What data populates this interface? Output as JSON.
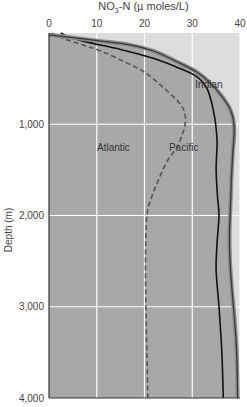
{
  "chart_data": {
    "type": "line",
    "title": "NO3-N (µ moles/L)",
    "xlabel": "NO3-N (µ moles/L)",
    "ylabel": "Depth (m)",
    "x_axis_position": "top",
    "y_axis_inverted": true,
    "xlim": [
      0,
      40
    ],
    "ylim": [
      0,
      4000
    ],
    "x_ticks": [
      0,
      10,
      20,
      30,
      40
    ],
    "x_tick_labels": [
      "0",
      "10",
      "20",
      "30",
      "40"
    ],
    "y_ticks": [
      1000,
      2000,
      3000,
      4000
    ],
    "y_tick_labels": [
      "1,000",
      "2,000",
      "3,000",
      "4,000"
    ],
    "grid": true,
    "legend": "inline labels",
    "series": [
      {
        "name": "Atlantic",
        "style": "dashed",
        "color": "#555555",
        "label_pos": {
          "x": 13.5,
          "y": 1250
        },
        "points": [
          [
            0.5,
            0
          ],
          [
            3,
            60
          ],
          [
            7,
            130
          ],
          [
            11,
            200
          ],
          [
            16,
            320
          ],
          [
            20,
            430
          ],
          [
            24,
            600
          ],
          [
            27.5,
            780
          ],
          [
            28.5,
            900
          ],
          [
            28.5,
            1000
          ],
          [
            28,
            1100
          ],
          [
            26.8,
            1250
          ],
          [
            24.8,
            1400
          ],
          [
            23,
            1600
          ],
          [
            21.5,
            1800
          ],
          [
            20.5,
            2000
          ],
          [
            20.2,
            2500
          ],
          [
            20.3,
            3000
          ],
          [
            20.5,
            3500
          ],
          [
            20.7,
            4000
          ]
        ]
      },
      {
        "name": "Pacific",
        "style": "solid",
        "color": "#111111",
        "label_pos": {
          "x": 28.2,
          "y": 1250
        },
        "points": [
          [
            2.5,
            0
          ],
          [
            4,
            40
          ],
          [
            8,
            100
          ],
          [
            15,
            180
          ],
          [
            22,
            280
          ],
          [
            27,
            380
          ],
          [
            31,
            480
          ],
          [
            33,
            600
          ],
          [
            34,
            750
          ],
          [
            34.6,
            900
          ],
          [
            34.9,
            1000
          ],
          [
            35.2,
            1200
          ],
          [
            35,
            1500
          ],
          [
            35.3,
            1800
          ],
          [
            35.6,
            2000
          ],
          [
            35.2,
            2300
          ],
          [
            35,
            2600
          ],
          [
            35.6,
            3000
          ],
          [
            36.2,
            3500
          ],
          [
            36.5,
            4000
          ]
        ]
      },
      {
        "name": "Indian",
        "style": "solid-thick",
        "color": "#666666",
        "label_pos": {
          "x": 33.5,
          "y": 560
        },
        "points": [
          [
            0,
            20
          ],
          [
            4,
            45
          ],
          [
            11,
            90
          ],
          [
            17,
            130
          ],
          [
            22,
            200
          ],
          [
            27,
            320
          ],
          [
            31,
            430
          ],
          [
            34,
            560
          ],
          [
            36,
            680
          ],
          [
            37.8,
            820
          ],
          [
            38.6,
            950
          ],
          [
            38.8,
            1100
          ],
          [
            38.5,
            1300
          ],
          [
            38.2,
            1600
          ],
          [
            38,
            1900
          ],
          [
            37.8,
            2200
          ],
          [
            37.9,
            2500
          ],
          [
            38.3,
            2800
          ],
          [
            38.8,
            3100
          ],
          [
            39.3,
            3500
          ],
          [
            39.5,
            4000
          ]
        ]
      }
    ],
    "colors": {
      "plot_fill_lower": "#a8a8a8",
      "plot_fill_upper": "#dcdcdc",
      "gridline": "#ffffff",
      "axis": "#333333"
    }
  },
  "labels": {
    "title_prefix": "NO",
    "title_sub": "3",
    "title_suffix": "-N (µ moles/L)"
  }
}
